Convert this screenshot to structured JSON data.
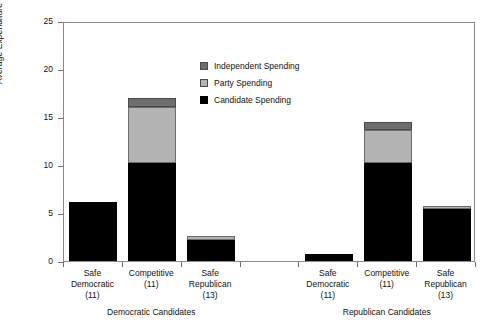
{
  "chart_data": {
    "type": "bar",
    "subtype": "stacked",
    "title": "",
    "xlabel": "",
    "ylabel": "Average Expenditure ($ Millions)",
    "ylim": [
      0,
      25
    ],
    "yticks": [
      0,
      5,
      10,
      15,
      20,
      25
    ],
    "grid": false,
    "legend_position": "inside-top-center",
    "series": [
      {
        "name": "Candidate Spending",
        "color": "#000000",
        "values": [
          6.1,
          10.2,
          2.2,
          null,
          0.7,
          10.2,
          5.4
        ]
      },
      {
        "name": "Party Spending",
        "color": "#b3b3b3",
        "values": [
          0.0,
          5.8,
          0.4,
          null,
          0.0,
          3.4,
          0.3
        ]
      },
      {
        "name": "Independent Spending",
        "color": "#6e6e6e",
        "values": [
          0.0,
          1.0,
          0.0,
          null,
          0.0,
          0.9,
          0.0
        ]
      }
    ],
    "totals": [
      6.1,
      17.0,
      2.6,
      null,
      0.7,
      14.5,
      5.7
    ],
    "categories": [
      {
        "line1": "Safe",
        "line2": "Democratic",
        "line3": "(11)",
        "group": "Democratic Candidates"
      },
      {
        "line1": "Competitive",
        "line2": "(11)",
        "line3": "",
        "group": "Democratic Candidates"
      },
      {
        "line1": "Safe",
        "line2": "Republican",
        "line3": "(13)",
        "group": "Democratic Candidates"
      },
      {
        "line1": "",
        "line2": "",
        "line3": "",
        "group": ""
      },
      {
        "line1": "Safe",
        "line2": "Democratic",
        "line3": "(11)",
        "group": "Republican Candidates"
      },
      {
        "line1": "Competitive",
        "line2": "(11)",
        "line3": "",
        "group": "Republican Candidates"
      },
      {
        "line1": "Safe",
        "line2": "Republican",
        "line3": "(13)",
        "group": "Republican Candidates"
      }
    ],
    "groups": [
      {
        "label": "Democratic Candidates"
      },
      {
        "label": "Republican Candidates"
      }
    ]
  },
  "legend": {
    "items": [
      {
        "label": "Independent Spending",
        "swatch": "independent-swatch"
      },
      {
        "label": "Party Spending",
        "swatch": "party-swatch"
      },
      {
        "label": "Candidate Spending",
        "swatch": "candidate-swatch"
      }
    ]
  },
  "axis": {
    "y_title": "Average Expenditure ($ Millions)",
    "y_labels": [
      "0",
      "5",
      "10",
      "15",
      "20",
      "25"
    ]
  }
}
